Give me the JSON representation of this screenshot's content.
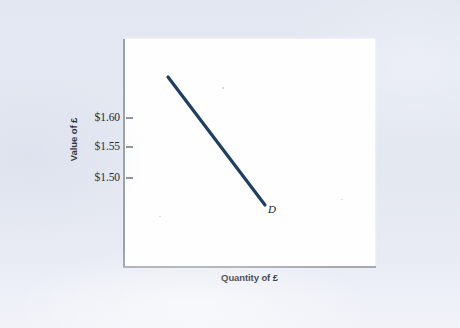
{
  "chart_data": {
    "type": "line",
    "title": "",
    "subtitle": "",
    "xlabel": "Quantity of £",
    "ylabel": "Value of £",
    "ytick_labels": [
      "$1.60",
      "$1.55",
      "$1.50"
    ],
    "ytick_values": [
      1.6,
      1.55,
      1.5
    ],
    "xtick_labels": [],
    "grid": false,
    "legend": null,
    "annotations": [
      {
        "text": "D",
        "meaning": "demand-curve-label",
        "x": 270,
        "y": 209
      }
    ],
    "series": [
      {
        "name": "D",
        "label": "D",
        "color": "#1d3f63",
        "description": "Downward sloping demand curve for pounds sterling",
        "points": [
          {
            "x": 168,
            "y": 77
          },
          {
            "x": 265,
            "y": 205
          }
        ],
        "value_at_start": 1.665,
        "value_at_end": 1.452
      }
    ],
    "axis_pixel_box": {
      "left": 124,
      "top": 39,
      "right": 375,
      "bottom": 267
    },
    "ylim_pixels": {
      "top": 39,
      "bottom": 267
    }
  },
  "figure": {
    "background_color": "#e3e7f0",
    "panel_color": "#fefefe",
    "axis_color": "#9a9fac",
    "curve_color": "#1d3f63",
    "text_color": "#12161d"
  },
  "axes": {
    "y_title": "Value of £",
    "x_title": "Quantity of £",
    "ticks": [
      {
        "label": "$1.60",
        "pixel_y": 117
      },
      {
        "label": "$1.55",
        "pixel_y": 146
      },
      {
        "label": "$1.50",
        "pixel_y": 177
      }
    ]
  },
  "curve": {
    "label": "D",
    "color": "#1d3f63",
    "stroke_width": 3.2,
    "x1": 168,
    "y1": 77,
    "x2": 265,
    "y2": 205
  }
}
